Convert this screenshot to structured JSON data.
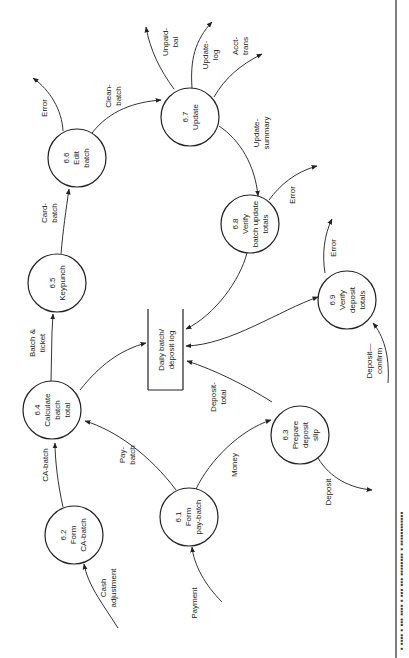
{
  "diagram": {
    "type": "data-flow-diagram",
    "orientation": "rotated-90-ccw",
    "processes": [
      {
        "id": "6.1",
        "lines": [
          "6.1",
          "Form",
          "pay-batch"
        ]
      },
      {
        "id": "6.2",
        "lines": [
          "6.2",
          "Form",
          "CA-batch"
        ]
      },
      {
        "id": "6.3",
        "lines": [
          "6.3",
          "Prepare",
          "deposit",
          "slip"
        ]
      },
      {
        "id": "6.4",
        "lines": [
          "6.4",
          "Calculate",
          "batch",
          "total"
        ]
      },
      {
        "id": "6.5",
        "lines": [
          "6.5",
          "Keypunch"
        ]
      },
      {
        "id": "6.6",
        "lines": [
          "6.6",
          "Edit",
          "batch"
        ]
      },
      {
        "id": "6.7",
        "lines": [
          "6.7",
          "Update"
        ]
      },
      {
        "id": "6.8",
        "lines": [
          "6.8",
          "Verify",
          "batch update",
          "totals"
        ]
      },
      {
        "id": "6.9",
        "lines": [
          "6.9",
          "Verify",
          "deposit",
          "totals"
        ]
      }
    ],
    "data_store": {
      "lines": [
        "Daily batch/",
        "deposit log"
      ]
    },
    "flows": {
      "cash_adjustment": [
        "Cash",
        "adjustment"
      ],
      "payment": [
        "Payment"
      ],
      "ca_batch": [
        "CA-batch"
      ],
      "pay_batch": [
        "Pay-",
        "batch"
      ],
      "money": [
        "Money"
      ],
      "deposit": [
        "Deposit"
      ],
      "deposit_total": [
        "Deposit-",
        "total"
      ],
      "batch_ticket": [
        "Batch &",
        "ticket"
      ],
      "card_batch": [
        "Card-",
        "batch"
      ],
      "error_66": [
        "Error"
      ],
      "clean_batch": [
        "Clean-",
        "batch"
      ],
      "unpaid_bal": [
        "Unpaid-",
        "bal"
      ],
      "update_log": [
        "Update-",
        "log"
      ],
      "acct_trans": [
        "Acct-",
        "trans"
      ],
      "update_summary": [
        "Update-",
        "summary"
      ],
      "error_68": [
        "Error"
      ],
      "error_69": [
        "Error"
      ],
      "deposit_confirm": [
        "Deposit—",
        "confirm"
      ]
    },
    "caption_fragment": "▪ ▪▪▪▪ ▪ ▪▪▪  ▪▪▪▪ ▪  ▪▪▪ ▪▪▪ ▪▪▪▪▪▪▪▪ ▪ ▪▪▪▪▪▪▪▪▪▪▪▪"
  }
}
